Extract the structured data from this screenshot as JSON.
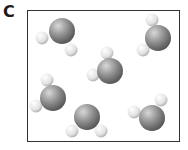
{
  "panel_label": "C",
  "diagram": {
    "type": "molecular-diagram",
    "colors": {
      "oxygen": "#8a8a8a",
      "hydrogen": "#e6e6e6",
      "border": "#333333"
    },
    "molecules": [
      {
        "O": [
          62,
          31
        ],
        "H": [
          [
            42,
            38
          ],
          [
            71,
            50
          ]
        ]
      },
      {
        "O": [
          158,
          38
        ],
        "H": [
          [
            152,
            20
          ],
          [
            143,
            50
          ]
        ]
      },
      {
        "O": [
          110,
          71
        ],
        "H": [
          [
            107,
            53
          ],
          [
            93,
            75
          ]
        ]
      },
      {
        "O": [
          53,
          98
        ],
        "H": [
          [
            47,
            80
          ],
          [
            36,
            106
          ]
        ]
      },
      {
        "O": [
          87,
          117
        ],
        "H": [
          [
            72,
            131
          ],
          [
            101,
            131
          ]
        ]
      },
      {
        "O": [
          152,
          118
        ],
        "H": [
          [
            161,
            100
          ],
          [
            134,
            112
          ]
        ]
      }
    ]
  }
}
